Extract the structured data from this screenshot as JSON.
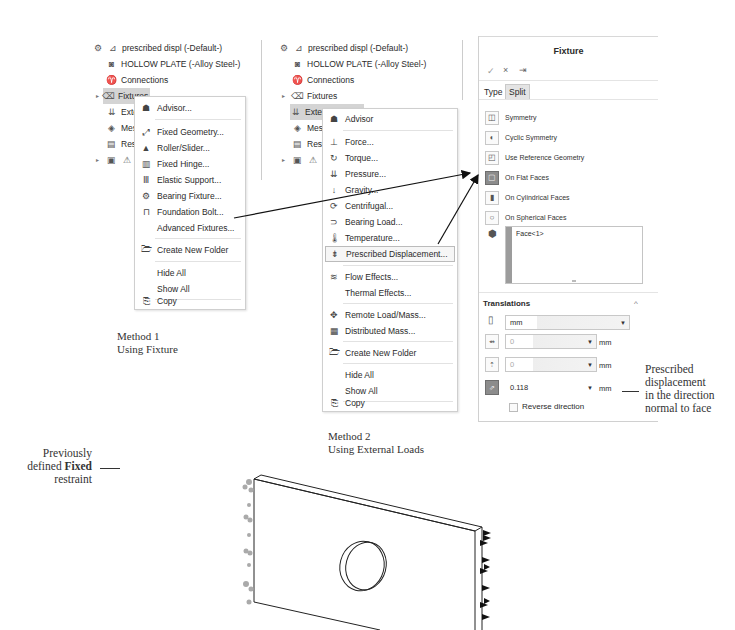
{
  "tree1": {
    "items": [
      {
        "label": "prescribed displ (-Default-)",
        "icon": "study-icon"
      },
      {
        "label": "HOLLOW PLATE (-Alloy Steel-)",
        "icon": "part-icon"
      },
      {
        "label": "Connections",
        "icon": "connections-icon"
      },
      {
        "label": "Fixtures",
        "icon": "fixtures-icon",
        "selected": true
      },
      {
        "label": "Extern",
        "icon": "external-loads-icon"
      },
      {
        "label": "Mesh",
        "icon": "mesh-icon"
      },
      {
        "label": "Result",
        "icon": "result-options-icon"
      },
      {
        "label": "Re",
        "icon": "results-folder-icon"
      }
    ]
  },
  "menu1": {
    "items": [
      {
        "label": "Advisor...",
        "u": "A",
        "icon": "advisor-icon"
      },
      {
        "label": "Fixed Geometry...",
        "icon": "fixed-geometry-icon"
      },
      {
        "label": "Roller/Slider...",
        "icon": "roller-slider-icon"
      },
      {
        "label": "Fixed Hinge...",
        "icon": "fixed-hinge-icon"
      },
      {
        "label": "Elastic Support...",
        "icon": "elastic-support-icon"
      },
      {
        "label": "Bearing Fixture...",
        "icon": "bearing-fixture-icon"
      },
      {
        "label": "Foundation Bolt...",
        "icon": "foundation-bolt-icon"
      },
      {
        "label": "Advanced Fixtures...",
        "icon": ""
      },
      {
        "label": "Create New Folder",
        "icon": "folder-icon"
      },
      {
        "label": "Hide All",
        "icon": ""
      },
      {
        "label": "Show All",
        "icon": ""
      },
      {
        "label": "Copy",
        "icon": "copy-icon"
      }
    ]
  },
  "tree2": {
    "items": [
      {
        "label": "prescribed displ (-Default-)"
      },
      {
        "label": "HOLLOW PLATE (-Alloy Steel-)"
      },
      {
        "label": "Connections"
      },
      {
        "label": "Fixtures"
      },
      {
        "label": "External Loads",
        "selected": true
      },
      {
        "label": "Mesh"
      },
      {
        "label": "Result"
      },
      {
        "label": "Re"
      }
    ]
  },
  "menu2": {
    "items": [
      {
        "label": "Advisor"
      },
      {
        "label": "Force..."
      },
      {
        "label": "Torque..."
      },
      {
        "label": "Pressure..."
      },
      {
        "label": "Gravity..."
      },
      {
        "label": "Centrifugal..."
      },
      {
        "label": "Bearing Load..."
      },
      {
        "label": "Temperature..."
      },
      {
        "label": "Prescribed Displacement..."
      },
      {
        "label": "Flow Effects..."
      },
      {
        "label": "Thermal Effects..."
      },
      {
        "label": "Remote Load/Mass..."
      },
      {
        "label": "Distributed Mass..."
      },
      {
        "label": "Create New Folder"
      },
      {
        "label": "Hide All"
      },
      {
        "label": "Show All"
      },
      {
        "label": "Copy"
      }
    ]
  },
  "panel": {
    "title": "Fixture",
    "ok": "✓",
    "cancel": "×",
    "pin": "⇥",
    "tabs": [
      "Type",
      "Split"
    ],
    "types": [
      {
        "label": "Symmetry"
      },
      {
        "label": "Cyclic Symmetry"
      },
      {
        "label": "Use Reference Geometry"
      },
      {
        "label": "On Flat Faces",
        "selected": true
      },
      {
        "label": "On Cylindrical Faces"
      },
      {
        "label": "On Spherical Faces"
      }
    ],
    "faces": "Face<1>",
    "translations": {
      "header": "Translations",
      "collapse": "^",
      "units": "mm",
      "dir1": {
        "value": "0",
        "unit": "mm"
      },
      "dir2": {
        "value": "0",
        "unit": "mm"
      },
      "normal": {
        "value": "0.118",
        "unit": "mm"
      },
      "reverse_label": "Reverse direction"
    }
  },
  "annotations": {
    "method1": [
      "Method 1",
      "Using Fixture"
    ],
    "method2": [
      "Method 2",
      "Using External Loads"
    ],
    "prescribed": [
      "Prescribed",
      "displacement",
      "in the direction",
      "normal to face"
    ],
    "fixed_pre": "Previously",
    "fixed_mid_a": "defined ",
    "fixed_mid_b": "Fixed",
    "fixed_post": "restraint"
  }
}
